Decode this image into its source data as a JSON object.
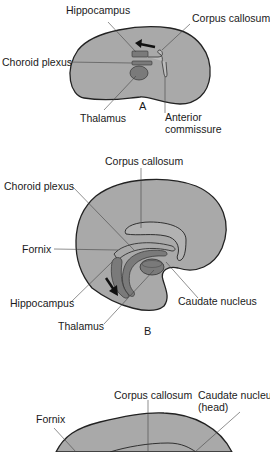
{
  "figure": {
    "colors": {
      "brain_fill": "#a9a9a9",
      "structure_fill": "#7a7a7a",
      "outline": "#222222",
      "leader": "#444444"
    },
    "panels": [
      {
        "id": "A",
        "letter": "A",
        "labels": {
          "hippocampus": "Hippocampus",
          "corpus_callosum": "Corpus callosum",
          "choroid_plexus": "Choroid plexus",
          "thalamus": "Thalamus",
          "anterior_commissure_1": "Anterior",
          "anterior_commissure_2": "commissure"
        }
      },
      {
        "id": "B",
        "letter": "B",
        "labels": {
          "corpus_callosum": "Corpus callosum",
          "choroid_plexus": "Choroid plexus",
          "fornix": "Fornix",
          "hippocampus": "Hippocampus",
          "caudate_nucleus": "Caudate nucleus",
          "thalamus": "Thalamus"
        }
      },
      {
        "id": "C",
        "letter": "",
        "labels": {
          "corpus_callosum": "Corpus callosum",
          "caudate_nucleus_1": "Caudate nucleus",
          "caudate_nucleus_2": "(head)",
          "fornix": "Fornix"
        }
      }
    ]
  }
}
